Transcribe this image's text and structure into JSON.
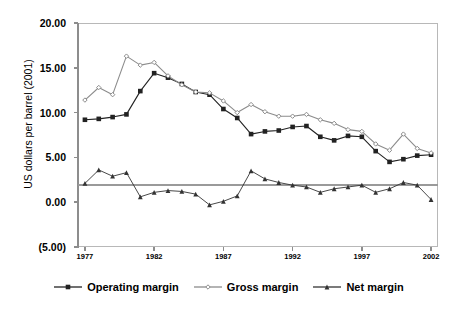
{
  "chart_data": {
    "type": "line",
    "title": "",
    "subtitle": "",
    "xlabel": "",
    "ylabel": "US dollars per barrel (2001)",
    "x": [
      1977,
      1978,
      1979,
      1980,
      1981,
      1982,
      1983,
      1984,
      1985,
      1986,
      1987,
      1988,
      1989,
      1990,
      1991,
      1992,
      1993,
      1994,
      1995,
      1996,
      1997,
      1998,
      1999,
      2000,
      2001,
      2002
    ],
    "xlim": [
      1976.5,
      2002.5
    ],
    "ylim": [
      -5,
      20
    ],
    "yticks": [
      20,
      15,
      10,
      5,
      0,
      -5
    ],
    "ytick_labels": [
      "20.00",
      "15.00",
      "10.00",
      "5.00",
      "0.00",
      "(5.00)"
    ],
    "xticks": [
      1977,
      1982,
      1987,
      1992,
      1997,
      2002
    ],
    "xtick_labels": [
      "1977",
      "1982",
      "1987",
      "1992",
      "1997",
      "2002"
    ],
    "grid": false,
    "legend_position": "bottom",
    "series": [
      {
        "name": "Operating margin",
        "color": "#222222",
        "marker": "square",
        "values": [
          9.2,
          9.3,
          9.5,
          9.8,
          12.4,
          14.4,
          13.9,
          13.2,
          12.3,
          12.0,
          10.4,
          9.4,
          7.6,
          7.9,
          8.0,
          8.4,
          8.5,
          7.3,
          6.9,
          7.4,
          7.3,
          5.7,
          4.5,
          4.8,
          5.2,
          5.3
        ]
      },
      {
        "name": "Gross margin",
        "color": "#8c8c8c",
        "marker": "diamond",
        "values": [
          11.4,
          12.8,
          12.0,
          16.3,
          15.3,
          15.6,
          14.1,
          13.1,
          12.3,
          12.2,
          11.3,
          10.0,
          10.9,
          10.1,
          9.6,
          9.6,
          9.8,
          9.2,
          8.8,
          8.1,
          7.9,
          6.5,
          5.8,
          7.6,
          6.0,
          5.5
        ]
      },
      {
        "name": "Net margin",
        "color": "#333333",
        "marker": "triangle",
        "values": [
          2.1,
          3.6,
          2.9,
          3.3,
          0.6,
          1.1,
          1.3,
          1.2,
          0.9,
          -0.3,
          0.1,
          0.7,
          3.5,
          2.6,
          2.2,
          1.9,
          1.7,
          1.1,
          1.5,
          1.7,
          1.9,
          1.1,
          1.5,
          2.2,
          1.9,
          0.3
        ]
      }
    ]
  },
  "legend": {
    "items": [
      {
        "label": "Operating margin"
      },
      {
        "label": "Gross margin"
      },
      {
        "label": "Net margin"
      }
    ]
  }
}
